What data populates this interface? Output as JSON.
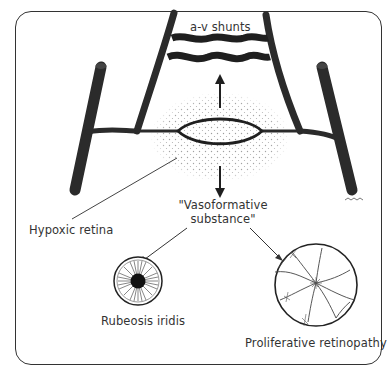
{
  "figure": {
    "labels": {
      "shunts": "a-v shunts",
      "hypoxic": "Hypoxic retina",
      "vaso_line1": "\"Vasoformative",
      "vaso_line2": "substance\"",
      "rubeosis": "Rubeosis iridis",
      "proliferative": "Proliferative retinopathy"
    },
    "colors": {
      "vessel": "#2b2b2b",
      "line": "#222222",
      "stipple": "#9a9a9a",
      "text": "#333333",
      "frame": "#333333"
    }
  }
}
